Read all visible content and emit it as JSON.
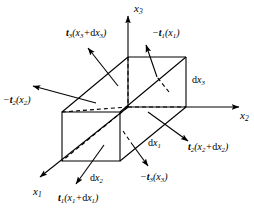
{
  "figure": {
    "background_color": "#ffffff",
    "line_color": "#000000"
  },
  "axes": [
    {
      "name": "x3-axis",
      "label_html": "x<sub>3</sub>",
      "direction": "up"
    },
    {
      "name": "x2-axis",
      "label_html": "x<sub>2</sub>",
      "direction": "right"
    },
    {
      "name": "x1-axis",
      "label_html": "x<sub>1</sub>",
      "direction": "down-left"
    }
  ],
  "axis_labels": {
    "x3": "x3",
    "x2": "x2",
    "x1": "x1"
  },
  "tractions": [
    {
      "name": "traction-t3-front",
      "label_html": "<span class=\"vec\">t</span><sub>3</sub>(x<sub>3</sub>+<span class=\"up\">d</span>x<sub>3</sub>)",
      "plain": "t3(x3+dx3)",
      "arrow_direction": "up-left",
      "dashed_tail": false
    },
    {
      "name": "traction-minus-t1",
      "label_html": "−<span class=\"vec\">t</span><sub>1</sub>(x<sub>1</sub>)",
      "plain": "-t1(x1)",
      "arrow_direction": "up-left",
      "dashed_tail": true
    },
    {
      "name": "traction-minus-t2",
      "label_html": "−<span class=\"vec\">t</span><sub>2</sub>(x<sub>2</sub>)",
      "plain": "-t2(x2)",
      "arrow_direction": "left",
      "dashed_tail": false
    },
    {
      "name": "traction-t2-far",
      "label_html": "<span class=\"vec\">t</span><sub>2</sub>(x<sub>2</sub>+<span class=\"up\">d</span>x<sub>2</sub>)",
      "plain": "t2(x2+dx2)",
      "arrow_direction": "down-right",
      "dashed_tail": false
    },
    {
      "name": "traction-minus-t3",
      "label_html": "−<span class=\"vec\">t</span><sub>3</sub>(x<sub>3</sub>)",
      "plain": "-t3(x3)",
      "arrow_direction": "down-right",
      "dashed_tail": true
    },
    {
      "name": "traction-t1-far",
      "label_html": "<span class=\"vec\">t</span><sub>1</sub>(x<sub>1</sub>+<span class=\"up\">d</span>x<sub>1</sub>)",
      "plain": "t1(x1+dx1)",
      "arrow_direction": "down-left",
      "dashed_tail": false
    }
  ],
  "dimensions": [
    {
      "name": "dimension-dx3",
      "label_html": "<span class=\"up\">d</span>x<sub>3</sub>",
      "plain": "dx3",
      "edge": "right-vertical"
    },
    {
      "name": "dimension-dx1",
      "label_html": "<span class=\"up\">d</span>x<sub>1</sub>",
      "plain": "dx1",
      "edge": "depth-diagonal"
    },
    {
      "name": "dimension-dx2",
      "label_html": "<span class=\"up\">d</span>x<sub>2</sub>",
      "plain": "dx2",
      "edge": "bottom-front"
    }
  ]
}
